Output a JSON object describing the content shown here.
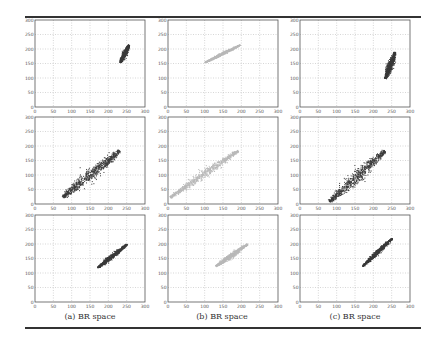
{
  "figure": {
    "captions": [
      "(a) BR space",
      "(b) BR space",
      "(c) BR space"
    ],
    "colors": {
      "dark": "#3a3a3a",
      "light": "#b8b8b8",
      "axis": "#555555",
      "grid": "#9a9a9a"
    }
  },
  "chart_data": [
    {
      "type": "scatter",
      "panel": "row1-col1",
      "column": "(a) BR space",
      "color": "#3a3a3a",
      "xlim": [
        0,
        300
      ],
      "ylim": [
        0,
        300
      ],
      "grid": true,
      "xticks": [
        0,
        50,
        100,
        150,
        200,
        250,
        300
      ],
      "yticks": [
        0,
        50,
        100,
        150,
        200,
        250,
        300
      ],
      "cluster": {
        "x_range": [
          232,
          255
        ],
        "y_range": [
          155,
          215
        ],
        "centroid": [
          245,
          185
        ],
        "shape": "narrow elongated, nearly vertical"
      }
    },
    {
      "type": "scatter",
      "panel": "row1-col2",
      "column": "(b) BR space",
      "color": "#b8b8b8",
      "xlim": [
        0,
        300
      ],
      "ylim": [
        0,
        300
      ],
      "grid": true,
      "xticks": [
        0,
        50,
        100,
        150,
        200,
        250,
        300
      ],
      "yticks": [
        0,
        50,
        100,
        150,
        200,
        250,
        300
      ],
      "cluster": {
        "x_range": [
          100,
          195
        ],
        "y_range": [
          155,
          215
        ],
        "centroid": [
          150,
          185
        ],
        "shape": "thin diagonal line"
      }
    },
    {
      "type": "scatter",
      "panel": "row1-col3",
      "column": "(c) BR space",
      "color": "#3a3a3a",
      "xlim": [
        0,
        300
      ],
      "ylim": [
        0,
        300
      ],
      "grid": true,
      "xticks": [
        0,
        50,
        100,
        150,
        200,
        250,
        300
      ],
      "yticks": [
        0,
        50,
        100,
        150,
        200,
        250,
        300
      ],
      "cluster": {
        "x_range": [
          232,
          258
        ],
        "y_range": [
          100,
          190
        ],
        "centroid": [
          248,
          150
        ],
        "shape": "elongated vertical blob"
      }
    },
    {
      "type": "scatter",
      "panel": "row2-col1",
      "column": "(a) BR space",
      "color": "#3a3a3a",
      "xlim": [
        0,
        300
      ],
      "ylim": [
        0,
        300
      ],
      "grid": true,
      "xticks": [
        0,
        50,
        100,
        150,
        200,
        250,
        300
      ],
      "yticks": [
        0,
        50,
        100,
        150,
        200,
        250,
        300
      ],
      "cluster": {
        "x_range": [
          75,
          230
        ],
        "y_range": [
          25,
          185
        ],
        "centroid": [
          170,
          115
        ],
        "shape": "wide diagonal band"
      }
    },
    {
      "type": "scatter",
      "panel": "row2-col2",
      "column": "(b) BR space",
      "color": "#b8b8b8",
      "xlim": [
        0,
        300
      ],
      "ylim": [
        0,
        300
      ],
      "grid": true,
      "xticks": [
        0,
        50,
        100,
        150,
        200,
        250,
        300
      ],
      "yticks": [
        0,
        50,
        100,
        150,
        200,
        250,
        300
      ],
      "cluster": {
        "x_range": [
          5,
          190
        ],
        "y_range": [
          25,
          185
        ],
        "centroid": [
          100,
          110
        ],
        "shape": "diagonal band"
      }
    },
    {
      "type": "scatter",
      "panel": "row2-col3",
      "column": "(c) BR space",
      "color": "#3a3a3a",
      "xlim": [
        0,
        300
      ],
      "ylim": [
        0,
        300
      ],
      "grid": true,
      "xticks": [
        0,
        50,
        100,
        150,
        200,
        250,
        300
      ],
      "yticks": [
        0,
        50,
        100,
        150,
        200,
        250,
        300
      ],
      "cluster": {
        "x_range": [
          80,
          230
        ],
        "y_range": [
          10,
          185
        ],
        "centroid": [
          165,
          95
        ],
        "shape": "wide diagonal ellipse"
      }
    },
    {
      "type": "scatter",
      "panel": "row3-col1",
      "column": "(a) BR space",
      "color": "#3a3a3a",
      "xlim": [
        0,
        300
      ],
      "ylim": [
        0,
        300
      ],
      "grid": true,
      "xticks": [
        0,
        50,
        100,
        150,
        200,
        250,
        300
      ],
      "yticks": [
        0,
        50,
        100,
        150,
        200,
        250,
        300
      ],
      "cluster": {
        "x_range": [
          170,
          250
        ],
        "y_range": [
          120,
          200
        ],
        "centroid": [
          210,
          160
        ],
        "shape": "narrow diagonal ellipse"
      }
    },
    {
      "type": "scatter",
      "panel": "row3-col2",
      "column": "(b) BR space",
      "color": "#b8b8b8",
      "xlim": [
        0,
        300
      ],
      "ylim": [
        0,
        300
      ],
      "grid": true,
      "xticks": [
        0,
        50,
        100,
        150,
        200,
        250,
        300
      ],
      "yticks": [
        0,
        50,
        100,
        150,
        200,
        250,
        300
      ],
      "cluster": {
        "x_range": [
          130,
          215
        ],
        "y_range": [
          125,
          200
        ],
        "centroid": [
          170,
          160
        ],
        "shape": "narrow diagonal ellipse"
      }
    },
    {
      "type": "scatter",
      "panel": "row3-col3",
      "column": "(c) BR space",
      "color": "#3a3a3a",
      "xlim": [
        0,
        300
      ],
      "ylim": [
        0,
        300
      ],
      "grid": true,
      "xticks": [
        0,
        50,
        100,
        150,
        200,
        250,
        300
      ],
      "yticks": [
        0,
        50,
        100,
        150,
        200,
        250,
        300
      ],
      "cluster": {
        "x_range": [
          170,
          250
        ],
        "y_range": [
          125,
          220
        ],
        "centroid": [
          210,
          170
        ],
        "shape": "narrow diagonal ellipse"
      }
    }
  ]
}
